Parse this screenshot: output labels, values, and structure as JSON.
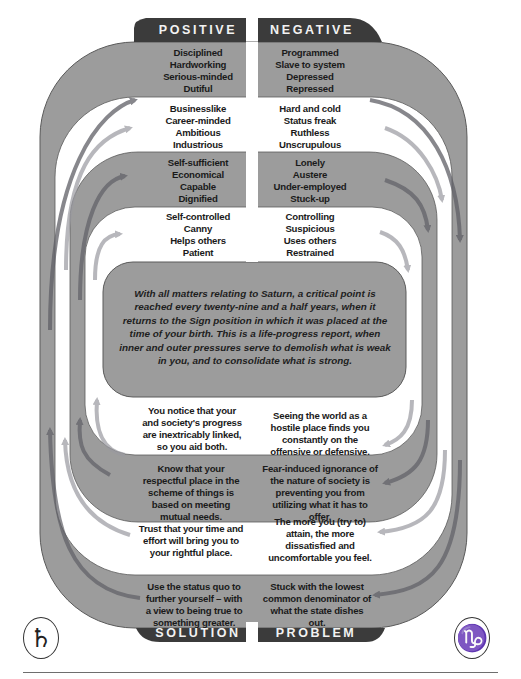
{
  "colors": {
    "band_gray": "#9c9c9c",
    "band_edge": "#5a5a5a",
    "label_dark": "#3b3b3b",
    "arrow_dark": "#5f5f66",
    "arrow_light": "#b5b5b5",
    "text": "#1a1a1a"
  },
  "labels": {
    "positive": "POSITIVE",
    "negative": "NEGATIVE",
    "solution": "SOLUTION",
    "problem": "PROBLEM"
  },
  "positive": [
    {
      "band": "gray",
      "lines": [
        "Disciplined",
        "Hardworking",
        "Serious-minded",
        "Dutiful"
      ]
    },
    {
      "band": "white",
      "lines": [
        "Businesslike",
        "Career-minded",
        "Ambitious",
        "Industrious"
      ]
    },
    {
      "band": "gray",
      "lines": [
        "Self-sufficient",
        "Economical",
        "Capable",
        "Dignified"
      ]
    },
    {
      "band": "white",
      "lines": [
        "Self-controlled",
        "Canny",
        "Helps others",
        "Patient"
      ]
    }
  ],
  "negative": [
    {
      "band": "gray",
      "lines": [
        "Programmed",
        "Slave to system",
        "Depressed",
        "Repressed"
      ]
    },
    {
      "band": "white",
      "lines": [
        "Hard and cold",
        "Status freak",
        "Ruthless",
        "Unscrupulous"
      ]
    },
    {
      "band": "gray",
      "lines": [
        "Lonely",
        "Austere",
        "Under-employed",
        "Stuck-up"
      ]
    },
    {
      "band": "white",
      "lines": [
        "Controlling",
        "Suspicious",
        "Uses others",
        "Restrained"
      ]
    }
  ],
  "center": {
    "text": "With all matters relating to Saturn, a critical point is reached every twenty-nine and a half years, when it returns to the Sign position in which it was placed at the time of your birth. This is a life-progress report, when inner and outer pressures serve to demolish what is weak in you, and to consolidate what is strong."
  },
  "solution": [
    {
      "band": "white",
      "text": "You notice that your and society's progress are inextricably linked, so you aid both."
    },
    {
      "band": "gray",
      "text": "Know that your respectful place in the scheme of things is based on meeting mutual needs."
    },
    {
      "band": "white",
      "text": "Trust that your time and effort will bring you to your rightful place."
    },
    {
      "band": "gray",
      "text": "Use the status quo to further yourself – with a view to being true to something greater."
    }
  ],
  "problem": [
    {
      "band": "white",
      "text": "Seeing the world as a hostile place finds you constantly on the offensive or defensive."
    },
    {
      "band": "gray",
      "text": "Fear-induced ignorance of the nature of society is preventing you from utilizing what it has to offer."
    },
    {
      "band": "white",
      "text": "The more you (try to) attain, the more dissatisfied and uncomfortable you feel."
    },
    {
      "band": "gray",
      "text": "Stuck with the lowest common denominator of what the state dishes out."
    }
  ],
  "symbols": {
    "saturn": {
      "name": "Saturn glyph",
      "char": "♄"
    },
    "capricorn": {
      "name": "Capricorn glyph",
      "char": "♑"
    }
  }
}
